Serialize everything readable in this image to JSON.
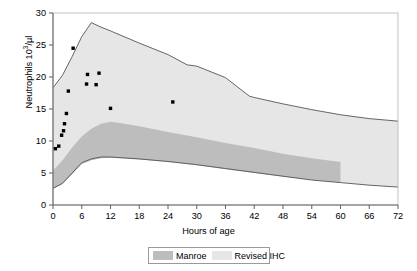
{
  "chart_data": {
    "type": "area",
    "title": "",
    "xlabel": "Hours of age",
    "ylabel": "Neutrophils 10³/µl",
    "ylabel_base": "Neutrophils 10",
    "ylabel_sup": "3",
    "ylabel_tail": "/µl",
    "xlim": [
      0,
      72
    ],
    "ylim": [
      0,
      30
    ],
    "xticks": [
      0,
      6,
      12,
      18,
      24,
      30,
      36,
      42,
      48,
      54,
      60,
      66,
      72
    ],
    "yticks": [
      0,
      5,
      10,
      15,
      20,
      25,
      30
    ],
    "grid": false,
    "legend_position": "bottom-center",
    "series": [
      {
        "name": "Revised IHC",
        "kind": "band",
        "color": "#e6e6e6",
        "outline": "#555555",
        "upper": [
          {
            "x": 0,
            "y": 18.3
          },
          {
            "x": 2,
            "y": 20.3
          },
          {
            "x": 4,
            "y": 23.2
          },
          {
            "x": 6,
            "y": 26.3
          },
          {
            "x": 8,
            "y": 28.5
          },
          {
            "x": 10,
            "y": 27.8
          },
          {
            "x": 12,
            "y": 27.2
          },
          {
            "x": 18,
            "y": 25.3
          },
          {
            "x": 24,
            "y": 23.5
          },
          {
            "x": 28,
            "y": 21.9
          },
          {
            "x": 30,
            "y": 21.7
          },
          {
            "x": 36,
            "y": 19.9
          },
          {
            "x": 41,
            "y": 17.0
          },
          {
            "x": 42,
            "y": 16.8
          },
          {
            "x": 48,
            "y": 15.8
          },
          {
            "x": 54,
            "y": 14.9
          },
          {
            "x": 60,
            "y": 14.1
          },
          {
            "x": 66,
            "y": 13.5
          },
          {
            "x": 72,
            "y": 13.1
          }
        ],
        "lower": [
          {
            "x": 0,
            "y": 2.6
          },
          {
            "x": 2,
            "y": 3.4
          },
          {
            "x": 4,
            "y": 5.0
          },
          {
            "x": 6,
            "y": 6.6
          },
          {
            "x": 8,
            "y": 7.2
          },
          {
            "x": 10,
            "y": 7.5
          },
          {
            "x": 12,
            "y": 7.5
          },
          {
            "x": 18,
            "y": 7.2
          },
          {
            "x": 24,
            "y": 6.8
          },
          {
            "x": 30,
            "y": 6.3
          },
          {
            "x": 36,
            "y": 5.7
          },
          {
            "x": 42,
            "y": 5.1
          },
          {
            "x": 48,
            "y": 4.5
          },
          {
            "x": 54,
            "y": 3.9
          },
          {
            "x": 60,
            "y": 3.5
          },
          {
            "x": 66,
            "y": 3.1
          },
          {
            "x": 72,
            "y": 2.8
          }
        ]
      },
      {
        "name": "Manroe",
        "kind": "band",
        "color": "#bdbdbd",
        "outline": "none",
        "xmax": 60,
        "upper": [
          {
            "x": 0,
            "y": 5.4
          },
          {
            "x": 2,
            "y": 7.0
          },
          {
            "x": 4,
            "y": 9.0
          },
          {
            "x": 6,
            "y": 10.7
          },
          {
            "x": 8,
            "y": 11.9
          },
          {
            "x": 10,
            "y": 12.7
          },
          {
            "x": 12,
            "y": 13.0
          },
          {
            "x": 14,
            "y": 12.8
          },
          {
            "x": 18,
            "y": 12.3
          },
          {
            "x": 24,
            "y": 11.4
          },
          {
            "x": 30,
            "y": 10.6
          },
          {
            "x": 36,
            "y": 9.7
          },
          {
            "x": 42,
            "y": 8.9
          },
          {
            "x": 48,
            "y": 8.0
          },
          {
            "x": 54,
            "y": 7.3
          },
          {
            "x": 60,
            "y": 6.7
          }
        ],
        "lower": [
          {
            "x": 0,
            "y": 2.5
          },
          {
            "x": 2,
            "y": 3.3
          },
          {
            "x": 4,
            "y": 4.8
          },
          {
            "x": 6,
            "y": 6.4
          },
          {
            "x": 8,
            "y": 7.0
          },
          {
            "x": 10,
            "y": 7.3
          },
          {
            "x": 12,
            "y": 7.4
          },
          {
            "x": 18,
            "y": 7.1
          },
          {
            "x": 24,
            "y": 6.7
          },
          {
            "x": 30,
            "y": 6.2
          },
          {
            "x": 36,
            "y": 5.6
          },
          {
            "x": 42,
            "y": 5.0
          },
          {
            "x": 48,
            "y": 4.4
          },
          {
            "x": 54,
            "y": 3.9
          },
          {
            "x": 60,
            "y": 3.5
          }
        ]
      },
      {
        "name": "Patient neutrophil counts",
        "kind": "scatter",
        "color": "#000000",
        "marker": "square",
        "points": [
          {
            "x": 0.5,
            "y": 8.8
          },
          {
            "x": 1.2,
            "y": 9.2
          },
          {
            "x": 1.8,
            "y": 10.9
          },
          {
            "x": 2.2,
            "y": 11.6
          },
          {
            "x": 2.4,
            "y": 12.7
          },
          {
            "x": 2.8,
            "y": 14.3
          },
          {
            "x": 3.2,
            "y": 17.8
          },
          {
            "x": 4.2,
            "y": 24.5
          },
          {
            "x": 7.2,
            "y": 20.4
          },
          {
            "x": 7.0,
            "y": 18.9
          },
          {
            "x": 9.0,
            "y": 18.8
          },
          {
            "x": 9.6,
            "y": 20.6
          },
          {
            "x": 12.0,
            "y": 15.1
          },
          {
            "x": 25.0,
            "y": 16.1
          }
        ]
      }
    ],
    "legend": [
      {
        "label": "Manroe",
        "color": "#bdbdbd"
      },
      {
        "label": "Revised IHC",
        "color": "#e6e6e6"
      }
    ]
  }
}
